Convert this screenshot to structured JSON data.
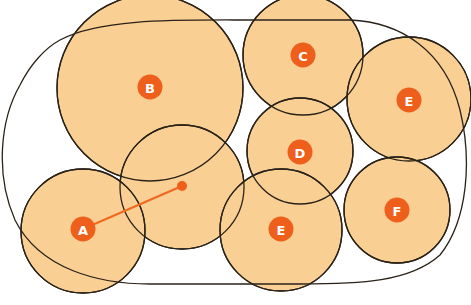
{
  "diagram": {
    "colors": {
      "circle_fill": "#f9cf94",
      "stroke": "#2a2218",
      "badge": "#ee5f1c",
      "badge_text": "#ffffff",
      "connector": "#ef6a1f"
    },
    "circles": [
      {
        "id": "B",
        "label": "B",
        "cx": 150,
        "cy": 88,
        "r": 93,
        "labeled": true
      },
      {
        "id": "C",
        "label": "C",
        "cx": 303,
        "cy": 55,
        "r": 60,
        "labeled": true
      },
      {
        "id": "E-top",
        "label": "E",
        "cx": 409,
        "cy": 99,
        "r": 62,
        "labeled": true
      },
      {
        "id": "D",
        "label": "D",
        "cx": 300,
        "cy": 151,
        "r": 53,
        "labeled": true
      },
      {
        "id": "middle",
        "label": "",
        "cx": 182,
        "cy": 187,
        "r": 62,
        "labeled": false
      },
      {
        "id": "A",
        "label": "A",
        "cx": 83,
        "cy": 231,
        "r": 62,
        "labeled": true
      },
      {
        "id": "E-bottom",
        "label": "E",
        "cx": 281,
        "cy": 230,
        "r": 61,
        "labeled": true
      },
      {
        "id": "F",
        "label": "F",
        "cx": 397,
        "cy": 210,
        "r": 53,
        "labeled": true
      }
    ],
    "badges": [
      {
        "label": "B",
        "x": 150,
        "y": 87
      },
      {
        "label": "C",
        "x": 303,
        "y": 55
      },
      {
        "label": "E",
        "x": 409,
        "y": 100
      },
      {
        "label": "D",
        "x": 300,
        "y": 152
      },
      {
        "label": "A",
        "x": 83,
        "y": 229
      },
      {
        "label": "E",
        "x": 281,
        "y": 229
      },
      {
        "label": "F",
        "x": 397,
        "y": 210
      }
    ],
    "connector": {
      "from": "A",
      "x1": 83,
      "y1": 229,
      "x2": 182,
      "y2": 186,
      "end_dot_radius": 5
    },
    "enclosure": {
      "shape": "rounded-outline",
      "left": 3,
      "top": 20,
      "right": 468,
      "bottom": 284
    }
  }
}
